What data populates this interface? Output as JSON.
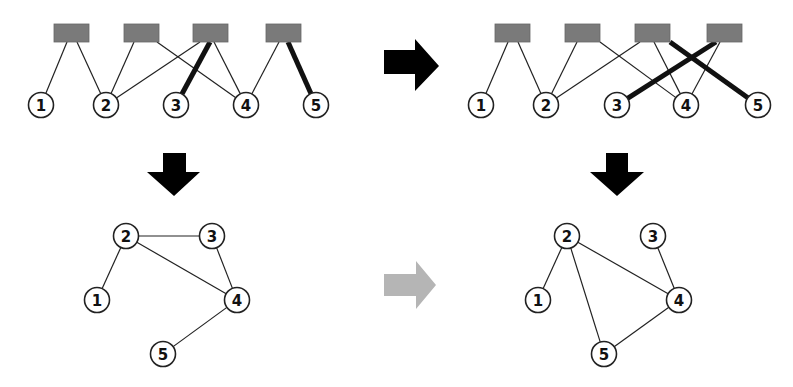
{
  "diagram": {
    "panels": [
      {
        "id": "top-left",
        "type": "bipartite",
        "box_nodes": [
          "A",
          "B",
          "C",
          "D"
        ],
        "circle_nodes": [
          "1",
          "2",
          "3",
          "4",
          "5"
        ],
        "edges": [
          {
            "from": "A",
            "to": "1",
            "bold": false
          },
          {
            "from": "A",
            "to": "2",
            "bold": false
          },
          {
            "from": "B",
            "to": "2",
            "bold": false
          },
          {
            "from": "B",
            "to": "4",
            "bold": false
          },
          {
            "from": "C",
            "to": "2",
            "bold": false
          },
          {
            "from": "C",
            "to": "3",
            "bold": true
          },
          {
            "from": "C",
            "to": "4",
            "bold": false
          },
          {
            "from": "D",
            "to": "4",
            "bold": false
          },
          {
            "from": "D",
            "to": "5",
            "bold": true
          }
        ]
      },
      {
        "id": "top-right",
        "type": "bipartite",
        "box_nodes": [
          "A",
          "B",
          "C",
          "D"
        ],
        "circle_nodes": [
          "1",
          "2",
          "3",
          "4",
          "5"
        ],
        "edges": [
          {
            "from": "A",
            "to": "1",
            "bold": false
          },
          {
            "from": "A",
            "to": "2",
            "bold": false
          },
          {
            "from": "B",
            "to": "2",
            "bold": false
          },
          {
            "from": "B",
            "to": "4",
            "bold": false
          },
          {
            "from": "C",
            "to": "2",
            "bold": false
          },
          {
            "from": "C",
            "to": "5",
            "bold": true
          },
          {
            "from": "C",
            "to": "4",
            "bold": false
          },
          {
            "from": "D",
            "to": "4",
            "bold": false
          },
          {
            "from": "D",
            "to": "3",
            "bold": true
          }
        ]
      },
      {
        "id": "bottom-left",
        "type": "projection",
        "nodes": [
          "1",
          "2",
          "3",
          "4",
          "5"
        ],
        "edges": [
          [
            "2",
            "1"
          ],
          [
            "2",
            "3"
          ],
          [
            "2",
            "4"
          ],
          [
            "3",
            "4"
          ],
          [
            "4",
            "5"
          ]
        ]
      },
      {
        "id": "bottom-right",
        "type": "projection",
        "nodes": [
          "1",
          "2",
          "3",
          "4",
          "5"
        ],
        "edges": [
          [
            "2",
            "1"
          ],
          [
            "2",
            "4"
          ],
          [
            "2",
            "5"
          ],
          [
            "3",
            "4"
          ],
          [
            "4",
            "5"
          ]
        ]
      }
    ],
    "arrows": [
      {
        "id": "arrow-top",
        "direction": "right",
        "from": "top-left",
        "to": "top-right",
        "color": "#000000"
      },
      {
        "id": "arrow-left-down",
        "direction": "down",
        "from": "top-left",
        "to": "bottom-left",
        "color": "#000000"
      },
      {
        "id": "arrow-right-down",
        "direction": "down",
        "from": "top-right",
        "to": "bottom-right",
        "color": "#000000"
      },
      {
        "id": "arrow-bottom",
        "direction": "right",
        "from": "bottom-left",
        "to": "bottom-right",
        "color": "#b5b5b5"
      }
    ]
  }
}
